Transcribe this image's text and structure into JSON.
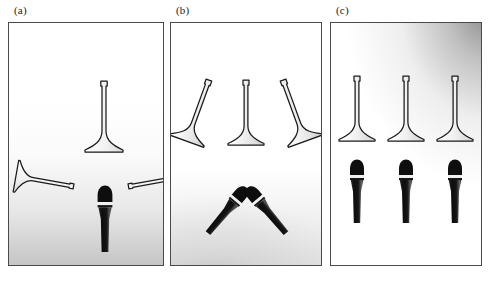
{
  "figure": {
    "background_color": "#ffffff",
    "border_color": "#4a4a4a",
    "icon_outline_color": "#1a1a1a",
    "icon_fill_color": "#ffffff",
    "microphone_color": "#111111",
    "panel_count": 3
  },
  "panels": [
    {
      "label": "(a)",
      "name": "panel-a",
      "gradient": {
        "description": "light gray shading rising from bottom edge",
        "class": "grad-a",
        "start_color": "#969696",
        "end_color": "#ffffff"
      },
      "horns": [
        {
          "name": "horn-upright-center",
          "orientation": "upright",
          "rotation_deg": 0,
          "x": 95,
          "y": 96
        },
        {
          "name": "horn-left-pointing-right",
          "orientation": "rotated-right",
          "rotation_deg": 100,
          "x": 36,
          "y": 160
        },
        {
          "name": "horn-right-pointing-left",
          "orientation": "rotated-left",
          "rotation_deg": -100,
          "x": 152,
          "y": 160
        }
      ],
      "microphones": [
        {
          "name": "microphone-center",
          "rotation_deg": 0,
          "x": 96,
          "y": 185
        }
      ],
      "horn_count": 3,
      "microphone_count": 1
    },
    {
      "label": "(b)",
      "name": "panel-b",
      "gradient": {
        "description": "soft gray shading at lower left area",
        "class": "grad-b",
        "start_color": "#8c8c8c",
        "end_color": "#ffffff"
      },
      "horns": [
        {
          "name": "horn-left-tilted",
          "orientation": "tilted-right",
          "rotation_deg": 22,
          "x": 26,
          "y": 88
        },
        {
          "name": "horn-upright-center",
          "orientation": "upright",
          "rotation_deg": 0,
          "x": 76,
          "y": 92
        },
        {
          "name": "horn-right-tilted",
          "orientation": "tilted-left",
          "rotation_deg": -22,
          "x": 126,
          "y": 88
        }
      ],
      "microphones": [
        {
          "name": "microphone-crossed-left",
          "rotation_deg": 38,
          "x": 66,
          "y": 182
        },
        {
          "name": "microphone-crossed-right",
          "rotation_deg": -38,
          "x": 86,
          "y": 182
        }
      ],
      "horn_count": 3,
      "microphone_count": 2
    },
    {
      "label": "(c)",
      "name": "panel-c",
      "gradient": {
        "description": "gray shading radiating from the upper right corner",
        "class": "grad-c",
        "start_color": "#5a5a5a",
        "end_color": "#ffffff"
      },
      "horns": [
        {
          "name": "horn-upright-left",
          "orientation": "upright",
          "rotation_deg": 0,
          "x": 27,
          "y": 88
        },
        {
          "name": "horn-upright-center",
          "orientation": "upright",
          "rotation_deg": 0,
          "x": 76,
          "y": 88
        },
        {
          "name": "horn-upright-right",
          "orientation": "upright",
          "rotation_deg": 0,
          "x": 125,
          "y": 88
        }
      ],
      "microphones": [
        {
          "name": "microphone-left",
          "rotation_deg": 0,
          "x": 27,
          "y": 158
        },
        {
          "name": "microphone-center",
          "rotation_deg": 0,
          "x": 76,
          "y": 158
        },
        {
          "name": "microphone-right",
          "rotation_deg": 0,
          "x": 125,
          "y": 158
        }
      ],
      "horn_count": 3,
      "microphone_count": 3
    }
  ]
}
